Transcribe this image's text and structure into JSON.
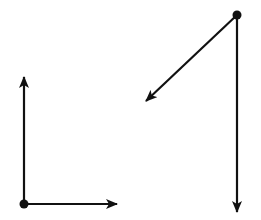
{
  "diagram": {
    "colors": {
      "background": "#ffffff",
      "stroke": "#111111"
    },
    "groups": [
      {
        "name": "orthogonal-axes",
        "origin": [
          24,
          204
        ],
        "vectors": [
          {
            "name": "vertical-up-vector",
            "from": [
              24,
              204
            ],
            "to": [
              24,
              77
            ]
          },
          {
            "name": "horizontal-right-vector",
            "from": [
              24,
              204
            ],
            "to": [
              117,
              204
            ]
          }
        ]
      },
      {
        "name": "split-vectors",
        "origin": [
          237,
          15
        ],
        "vectors": [
          {
            "name": "diagonal-down-left-vector",
            "from": [
              237,
              15
            ],
            "to": [
              146,
              101
            ]
          },
          {
            "name": "vertical-down-vector",
            "from": [
              237,
              15
            ],
            "to": [
              237,
              212
            ]
          }
        ]
      }
    ]
  }
}
